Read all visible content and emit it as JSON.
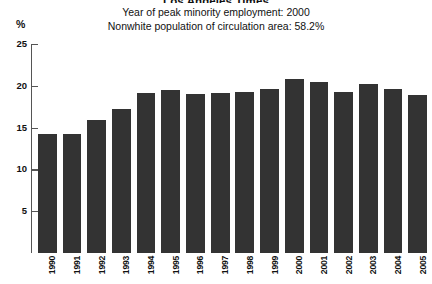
{
  "header": {
    "title": "Los Angeles Times",
    "subtitle_1": "Year of peak minority employment: 2000",
    "subtitle_2": "Nonwhite population of circulation area: 58.2%"
  },
  "axis": {
    "unit_label": "%"
  },
  "colors": {
    "bar": "#333333",
    "axis": "#555555",
    "text": "#111111",
    "background": "#ffffff"
  },
  "chart_data": {
    "type": "bar",
    "title": "Los Angeles Times",
    "subtitle": "Year of peak minority employment: 2000 / Nonwhite population of circulation area: 58.2%",
    "xlabel": "",
    "ylabel": "%",
    "ylim": [
      0,
      25
    ],
    "yticks": [
      0,
      5,
      10,
      15,
      20,
      25
    ],
    "ytick_labels": [
      "0",
      "5",
      "10",
      "15",
      "20",
      "25"
    ],
    "grid": false,
    "legend": "none",
    "categories": [
      "1990",
      "1991",
      "1992",
      "1993",
      "1994",
      "1995",
      "1996",
      "1997",
      "1998",
      "1999",
      "2000",
      "2001",
      "2002",
      "2003",
      "2004",
      "2005"
    ],
    "values": [
      14.2,
      14.2,
      15.9,
      17.2,
      19.2,
      19.5,
      19.0,
      19.1,
      19.3,
      19.6,
      20.8,
      20.4,
      19.3,
      20.2,
      19.6,
      18.9
    ],
    "annotations": {
      "peak_minority_employment_year": "2000",
      "nonwhite_population_of_circulation_area": "58.2%"
    }
  }
}
